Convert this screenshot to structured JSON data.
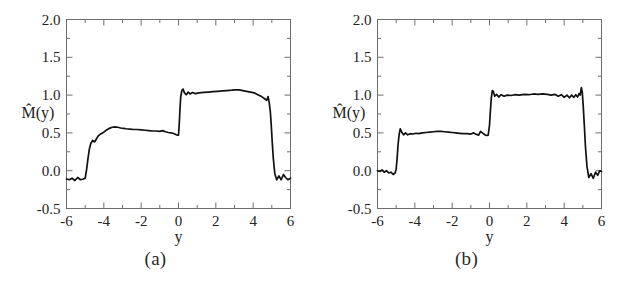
{
  "figure": {
    "background_color": "#ffffff",
    "curve_color": "#111111",
    "frame_color": "#6e6e6e",
    "panels": [
      {
        "caption": "(a)",
        "name": "panel-a"
      },
      {
        "caption": "(b)",
        "name": "panel-b"
      }
    ]
  },
  "chart_data": [
    {
      "type": "line",
      "title": "",
      "subtitle": "",
      "panel_label": "(a)",
      "xlabel": "y",
      "ylabel": "M̂(y)",
      "ylabel_plain": "M-hat(y)",
      "xlim": [
        -6,
        6
      ],
      "ylim": [
        -0.5,
        2.0
      ],
      "xticks": [
        -6,
        -4,
        -2,
        0,
        2,
        4,
        6
      ],
      "xtick_labels": [
        "-6",
        "-4",
        "-2",
        "0",
        "2",
        "4",
        "6"
      ],
      "xminor_ticks": [
        -5,
        -3,
        -1,
        1,
        3,
        5
      ],
      "yticks": [
        -0.5,
        0.0,
        0.5,
        1.0,
        1.5,
        2.0
      ],
      "ytick_labels": [
        "-0.5",
        "0.0",
        "0.5",
        "1.0",
        "1.5",
        "2.0"
      ],
      "yminor_ticks": [
        -0.25,
        0.25,
        0.75,
        1.25,
        1.75
      ],
      "grid": false,
      "legend": null,
      "legend_position": "none",
      "annotations": [],
      "x": [
        -6.0,
        -5.85,
        -5.7,
        -5.55,
        -5.4,
        -5.25,
        -5.1,
        -5.0,
        -4.92,
        -4.85,
        -4.78,
        -4.7,
        -4.6,
        -4.5,
        -4.4,
        -4.3,
        -4.15,
        -4.0,
        -3.85,
        -3.7,
        -3.55,
        -3.4,
        -3.25,
        -3.1,
        -2.95,
        -2.8,
        -2.6,
        -2.4,
        -2.2,
        -2.0,
        -1.8,
        -1.6,
        -1.4,
        -1.2,
        -1.0,
        -0.85,
        -0.7,
        -0.55,
        -0.42,
        -0.3,
        -0.2,
        -0.12,
        -0.06,
        0.0,
        0.04,
        0.08,
        0.12,
        0.18,
        0.24,
        0.32,
        0.42,
        0.52,
        0.62,
        0.75,
        0.9,
        1.1,
        1.35,
        1.6,
        1.85,
        2.1,
        2.35,
        2.6,
        2.85,
        3.05,
        3.25,
        3.45,
        3.65,
        3.85,
        4.05,
        4.25,
        4.45,
        4.6,
        4.72,
        4.8,
        4.86,
        4.92,
        4.97,
        5.02,
        5.08,
        5.16,
        5.26,
        5.38,
        5.5,
        5.62,
        5.74,
        5.86,
        6.0
      ],
      "values": [
        -0.11,
        -0.12,
        -0.1,
        -0.13,
        -0.09,
        -0.12,
        -0.11,
        -0.1,
        0.02,
        0.16,
        0.28,
        0.36,
        0.4,
        0.38,
        0.42,
        0.46,
        0.49,
        0.51,
        0.54,
        0.56,
        0.575,
        0.58,
        0.575,
        0.565,
        0.56,
        0.555,
        0.55,
        0.545,
        0.545,
        0.54,
        0.535,
        0.53,
        0.525,
        0.525,
        0.52,
        0.53,
        0.515,
        0.505,
        0.5,
        0.495,
        0.485,
        0.475,
        0.47,
        0.47,
        0.62,
        0.82,
        0.98,
        1.06,
        1.08,
        1.03,
        1.005,
        1.04,
        1.015,
        1.035,
        1.02,
        1.03,
        1.035,
        1.04,
        1.045,
        1.05,
        1.055,
        1.06,
        1.065,
        1.07,
        1.068,
        1.06,
        1.05,
        1.04,
        1.03,
        1.005,
        0.98,
        0.955,
        0.93,
        0.98,
        0.9,
        0.78,
        0.6,
        0.38,
        0.16,
        -0.04,
        -0.12,
        -0.07,
        -0.12,
        -0.05,
        -0.09,
        -0.12,
        -0.1,
        -0.11
      ]
    },
    {
      "type": "line",
      "title": "",
      "subtitle": "",
      "panel_label": "(b)",
      "xlabel": "y",
      "ylabel": "M̂(y)",
      "ylabel_plain": "M-hat(y)",
      "xlim": [
        -6,
        6
      ],
      "ylim": [
        -0.5,
        2.0
      ],
      "xticks": [
        -6,
        -4,
        -2,
        0,
        2,
        4,
        6
      ],
      "xtick_labels": [
        "-6",
        "-4",
        "-2",
        "0",
        "2",
        "4",
        "6"
      ],
      "xminor_ticks": [
        -5,
        -3,
        -1,
        1,
        3,
        5
      ],
      "yticks": [
        -0.5,
        0.0,
        0.5,
        1.0,
        1.5,
        2.0
      ],
      "ytick_labels": [
        "-0.5",
        "0.0",
        "0.5",
        "1.0",
        "1.5",
        "2.0"
      ],
      "yminor_ticks": [
        -0.25,
        0.25,
        0.75,
        1.25,
        1.75
      ],
      "grid": false,
      "legend": null,
      "legend_position": "none",
      "annotations": [],
      "x": [
        -6.0,
        -5.88,
        -5.76,
        -5.64,
        -5.52,
        -5.4,
        -5.28,
        -5.16,
        -5.06,
        -5.0,
        -4.95,
        -4.9,
        -4.84,
        -4.78,
        -4.7,
        -4.6,
        -4.5,
        -4.38,
        -4.25,
        -4.1,
        -3.95,
        -3.8,
        -3.6,
        -3.4,
        -3.2,
        -3.0,
        -2.8,
        -2.6,
        -2.4,
        -2.2,
        -2.0,
        -1.8,
        -1.6,
        -1.4,
        -1.2,
        -1.0,
        -0.85,
        -0.7,
        -0.58,
        -0.48,
        -0.38,
        -0.3,
        -0.22,
        -0.14,
        -0.07,
        0.0,
        0.05,
        0.1,
        0.15,
        0.2,
        0.28,
        0.38,
        0.5,
        0.62,
        0.78,
        0.95,
        1.15,
        1.35,
        1.6,
        1.85,
        2.1,
        2.35,
        2.6,
        2.85,
        3.1,
        3.3,
        3.5,
        3.68,
        3.85,
        4.0,
        4.15,
        4.28,
        4.4,
        4.52,
        4.62,
        4.72,
        4.8,
        4.86,
        4.92,
        4.97,
        5.02,
        5.08,
        5.14,
        5.22,
        5.32,
        5.44,
        5.56,
        5.68,
        5.8,
        5.9,
        6.0
      ],
      "values": [
        0.0,
        -0.01,
        0.01,
        -0.02,
        0.0,
        -0.03,
        -0.02,
        -0.05,
        -0.03,
        0.02,
        0.16,
        0.34,
        0.48,
        0.555,
        0.51,
        0.475,
        0.5,
        0.475,
        0.49,
        0.485,
        0.495,
        0.49,
        0.5,
        0.505,
        0.51,
        0.515,
        0.52,
        0.52,
        0.515,
        0.51,
        0.505,
        0.5,
        0.495,
        0.49,
        0.49,
        0.485,
        0.5,
        0.48,
        0.47,
        0.52,
        0.5,
        0.485,
        0.47,
        0.465,
        0.47,
        0.6,
        0.8,
        0.97,
        1.06,
        1.05,
        0.985,
        1.01,
        0.975,
        1.005,
        0.985,
        1.0,
        0.995,
        1.005,
        1.0,
        1.01,
        1.005,
        1.015,
        1.01,
        1.015,
        1.01,
        1.0,
        1.01,
        0.985,
        1.005,
        0.97,
        1.0,
        0.965,
        1.0,
        0.97,
        1.005,
        0.975,
        1.02,
        1.0,
        1.1,
        1.04,
        0.86,
        0.6,
        0.32,
        0.06,
        -0.09,
        -0.04,
        -0.1,
        -0.02,
        -0.06,
        0.0,
        -0.01,
        0.0
      ]
    }
  ]
}
